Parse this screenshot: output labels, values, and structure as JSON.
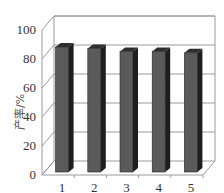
{
  "chart_data": {
    "type": "bar",
    "style": "3d",
    "title": "",
    "xlabel": "",
    "ylabel": "产率/%",
    "categories": [
      "1",
      "2",
      "3",
      "4",
      "5"
    ],
    "values": [
      91,
      90,
      88,
      88,
      87
    ],
    "ylim": [
      0,
      100
    ],
    "yticks": [
      "0",
      "20",
      "40",
      "60",
      "80",
      "100"
    ],
    "grid": true,
    "legend": null,
    "colors": {
      "bar_front": "#5a5a5a",
      "bar_side": "#1e1e1e",
      "bar_top": "#2e2e2e",
      "grid": "#9a9a9a"
    }
  }
}
